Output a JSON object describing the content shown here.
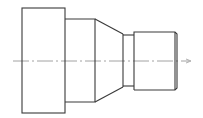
{
  "drawing": {
    "type": "stepped-shaft-side-view",
    "colors": {
      "outline": "#3a3a3a",
      "centerline": "#8a8a8a",
      "background": "#ffffff"
    },
    "centerline": {
      "x1": 13,
      "x2": 192,
      "y": 61
    },
    "sections": [
      {
        "name": "large-collar",
        "x1": 22,
        "x2": 65,
        "y_top": 8,
        "y_bottom": 113
      },
      {
        "name": "shoulder",
        "x1": 65,
        "x2": 95,
        "y_top": 19,
        "y_bottom": 102
      },
      {
        "name": "taper",
        "x1": 95,
        "x2": 123,
        "y_top_start": 19,
        "y_top_end": 34,
        "y_bottom_start": 102,
        "y_bottom_end": 87
      },
      {
        "name": "neck-groove",
        "x1": 123,
        "x2": 134,
        "y_top": 35,
        "y_bottom": 86
      },
      {
        "name": "end-journal",
        "x1": 134,
        "x2": 175,
        "y_top": 32,
        "y_bottom": 90
      },
      {
        "name": "end-chamfer",
        "x1": 175,
        "x2": 177,
        "y_top": 33,
        "y_bottom": 89
      }
    ]
  }
}
